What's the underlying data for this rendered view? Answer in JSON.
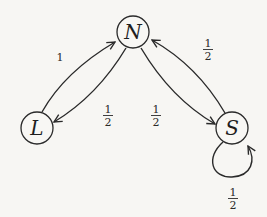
{
  "diagram": {
    "type": "markov-chain",
    "nodes": [
      {
        "id": "N",
        "label": "N"
      },
      {
        "id": "L",
        "label": "L"
      },
      {
        "id": "S",
        "label": "S"
      }
    ],
    "edges": [
      {
        "from": "L",
        "to": "N",
        "label": "1",
        "num": "1",
        "den": ""
      },
      {
        "from": "N",
        "to": "L",
        "label": "1/2",
        "num": "1",
        "den": "2"
      },
      {
        "from": "N",
        "to": "S",
        "label": "1/2",
        "num": "1",
        "den": "2"
      },
      {
        "from": "S",
        "to": "N",
        "label": "1/2",
        "num": "1",
        "den": "2"
      },
      {
        "from": "S",
        "to": "S",
        "label": "1/2",
        "num": "1",
        "den": "2"
      }
    ]
  }
}
